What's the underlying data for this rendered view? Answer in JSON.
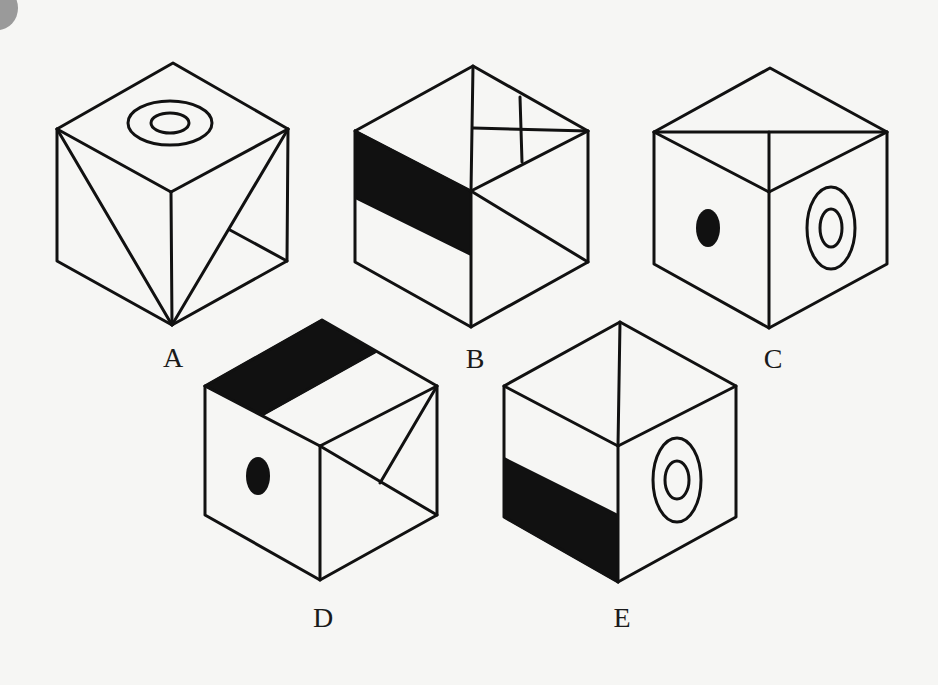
{
  "figure": {
    "cubes": [
      {
        "label": "A",
        "label_pos": [
          173,
          358
        ],
        "vertices": {
          "top": [
            173,
            63
          ],
          "lt": [
            57,
            129
          ],
          "rt": [
            288,
            129
          ],
          "c": [
            171,
            192
          ],
          "lb": [
            57,
            261
          ],
          "rb": [
            287,
            261
          ],
          "b": [
            172,
            325
          ]
        },
        "top_face": "concentric-rings",
        "left_face": "diagonal-line",
        "right_face": "diagonal-with-branch"
      },
      {
        "label": "B",
        "label_pos": [
          475,
          359
        ],
        "vertices": {
          "top": [
            473,
            66
          ],
          "lt": [
            355,
            131
          ],
          "rt": [
            588,
            131
          ],
          "c": [
            471,
            191
          ],
          "lb": [
            355,
            262
          ],
          "rb": [
            588,
            262
          ],
          "b": [
            471,
            327
          ]
        },
        "top_face": "cross-lines",
        "left_face": "black-band",
        "right_face": "diagonal-line"
      },
      {
        "label": "C",
        "label_pos": [
          773,
          359
        ],
        "vertices": {
          "top": [
            770,
            68
          ],
          "lt": [
            654,
            132
          ],
          "rt": [
            887,
            132
          ],
          "c": [
            769,
            192
          ],
          "lb": [
            654,
            264
          ],
          "rb": [
            887,
            264
          ],
          "b": [
            769,
            328
          ]
        },
        "top_face": "t-lines",
        "left_face": "black-dot",
        "right_face": "concentric-rings"
      },
      {
        "label": "D",
        "label_pos": [
          323,
          618
        ],
        "vertices": {
          "top": [
            322,
            320
          ],
          "lt": [
            205,
            386
          ],
          "rt": [
            437,
            386
          ],
          "c": [
            320,
            446
          ],
          "lb": [
            205,
            515
          ],
          "rb": [
            437,
            515
          ],
          "b": [
            320,
            580
          ]
        },
        "top_face": "black-band",
        "left_face": "black-dot",
        "right_face": "diagonal-with-branch"
      },
      {
        "label": "E",
        "label_pos": [
          622,
          618
        ],
        "vertices": {
          "top": [
            620,
            322
          ],
          "lt": [
            504,
            386
          ],
          "rt": [
            736,
            386
          ],
          "c": [
            618,
            446
          ],
          "lb": [
            504,
            517
          ],
          "rb": [
            736,
            517
          ],
          "b": [
            618,
            582
          ]
        },
        "top_face": "center-line",
        "left_face": "black-band-bottom",
        "right_face": "concentric-rings"
      }
    ]
  },
  "colors": {
    "background": "#f6f6f4",
    "ink": "#111111",
    "corner_mark": "#9a9a9a"
  }
}
